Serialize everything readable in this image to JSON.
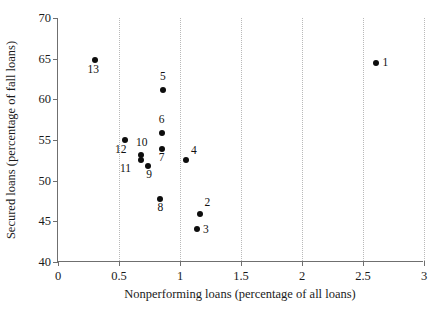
{
  "chart_data": {
    "type": "scatter",
    "title": "",
    "xlabel": "Nonperforming loans (percentage of all loans)",
    "ylabel": "Secured loans (percentage of fall loans)",
    "xlim": [
      0,
      3
    ],
    "ylim": [
      40,
      70
    ],
    "xticks": [
      0,
      0.5,
      1,
      1.5,
      2,
      2.5,
      3
    ],
    "xticklabels": [
      "0",
      "0.5",
      "1",
      "1.5",
      "2",
      "2.5",
      "3"
    ],
    "yticks": [
      40,
      45,
      50,
      55,
      60,
      65,
      70
    ],
    "yticklabels": [
      "40",
      "45",
      "50",
      "55",
      "60",
      "65",
      "70"
    ],
    "grid": "vertical-dotted",
    "legend": "none",
    "marker": "filled-circle",
    "marker_color": "#0d0d0d",
    "points": [
      {
        "label": "1",
        "x": 2.61,
        "y": 64.5,
        "lx": 6,
        "ly": -6
      },
      {
        "label": "2",
        "x": 1.16,
        "y": 45.9,
        "lx": 5,
        "ly": -17
      },
      {
        "label": "3",
        "x": 1.14,
        "y": 44.1,
        "lx": 6,
        "ly": -5
      },
      {
        "label": "4",
        "x": 1.05,
        "y": 52.6,
        "lx": 5,
        "ly": -15
      },
      {
        "label": "5",
        "x": 0.86,
        "y": 61.2,
        "lx": -3,
        "ly": -19
      },
      {
        "label": "6",
        "x": 0.85,
        "y": 55.9,
        "lx": -3,
        "ly": -19
      },
      {
        "label": "7",
        "x": 0.85,
        "y": 53.9,
        "lx": -3,
        "ly": 3
      },
      {
        "label": "8",
        "x": 0.84,
        "y": 47.7,
        "lx": -3,
        "ly": 3
      },
      {
        "label": "9",
        "x": 0.74,
        "y": 51.8,
        "lx": -2,
        "ly": 3
      },
      {
        "label": "10",
        "x": 0.68,
        "y": 53.1,
        "lx": -5,
        "ly": -18
      },
      {
        "label": "11",
        "x": 0.68,
        "y": 52.5,
        "lx": -21,
        "ly": 3
      },
      {
        "label": "12",
        "x": 0.55,
        "y": 55.0,
        "lx": -10,
        "ly": 4
      },
      {
        "label": "13",
        "x": 0.3,
        "y": 64.8,
        "lx": -7,
        "ly": 4
      }
    ]
  }
}
